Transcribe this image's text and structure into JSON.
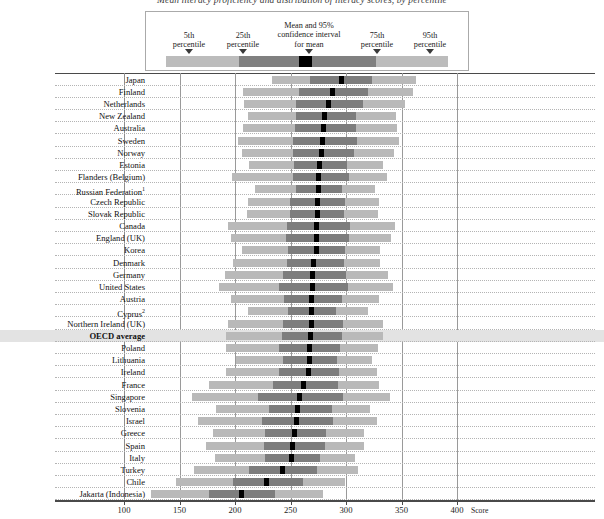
{
  "title": "Mean literacy proficiency and distribution of literacy scores, by percentile",
  "legend": {
    "items": [
      {
        "name": "p5",
        "label": "5th\npercentile",
        "value": 5
      },
      {
        "name": "p25",
        "label": "25th\npercentile",
        "value": 25
      },
      {
        "name": "mean",
        "label": "Mean and 95%\nconfidence interval\nfor mean",
        "value": 50
      },
      {
        "name": "p75",
        "label": "75th\npercentile",
        "value": 75
      },
      {
        "name": "p95",
        "label": "95th\npercentile",
        "value": 95
      }
    ],
    "labels": {
      "p5_line1": "5th",
      "p5_line2": "percentile",
      "p25_line1": "25th",
      "p25_line2": "percentile",
      "mean_line1": "Mean and 95%",
      "mean_line2": "confidence interval",
      "mean_line3": "for mean",
      "p75_line1": "75th",
      "p75_line2": "percentile",
      "p95_line1": "95th",
      "p95_line2": "percentile"
    }
  },
  "axis": {
    "label": "Score",
    "ticks": [
      100,
      150,
      200,
      250,
      300,
      350,
      400
    ],
    "tick_labels": [
      "100",
      "150",
      "200",
      "250",
      "300",
      "350",
      "400"
    ],
    "min": 100,
    "max": 400,
    "px_at_min": 124,
    "px_at_max": 457
  },
  "chart_data": {
    "type": "bar",
    "title": "Mean literacy proficiency and distribution of literacy scores, by percentile",
    "xlabel": "Score",
    "ylabel": "",
    "xlim": [
      100,
      400
    ],
    "grid": true,
    "legend_position": "top",
    "series_description": "Horizontal range bars showing 5th-95th percentile (light grey), 25th-75th percentile (dark grey), and mean with 95% confidence interval (black marker)",
    "categories": [
      "Japan",
      "Finland",
      "Netherlands",
      "New Zealand",
      "Australia",
      "Sweden",
      "Norway",
      "Estonia",
      "Flanders (Belgium)",
      "Russian Federation",
      "Czech Republic",
      "Slovak Republic",
      "Canada",
      "England (UK)",
      "Korea",
      "Denmark",
      "Germany",
      "United States",
      "Austria",
      "Cyprus",
      "Northern Ireland (UK)",
      "OECD average",
      "Poland",
      "Lithuania",
      "Ireland",
      "France",
      "Singapore",
      "Slovenia",
      "Israel",
      "Greece",
      "Spain",
      "Italy",
      "Turkey",
      "Chile",
      "Jakarta (Indonesia)"
    ],
    "rows": [
      {
        "country": "Japan",
        "footnote": null,
        "highlight": false,
        "bold": false,
        "p5": 233,
        "p25": 268,
        "mean": 296,
        "p75": 323,
        "p95": 363
      },
      {
        "country": "Finland",
        "footnote": null,
        "highlight": false,
        "bold": false,
        "p5": 207,
        "p25": 258,
        "mean": 288,
        "p75": 320,
        "p95": 360
      },
      {
        "country": "Netherlands",
        "footnote": null,
        "highlight": false,
        "bold": false,
        "p5": 208,
        "p25": 255,
        "mean": 284,
        "p75": 315,
        "p95": 353
      },
      {
        "country": "New Zealand",
        "footnote": null,
        "highlight": false,
        "bold": false,
        "p5": 212,
        "p25": 255,
        "mean": 281,
        "p75": 309,
        "p95": 345
      },
      {
        "country": "Australia",
        "footnote": null,
        "highlight": false,
        "bold": false,
        "p5": 207,
        "p25": 254,
        "mean": 280,
        "p75": 309,
        "p95": 346
      },
      {
        "country": "Sweden",
        "footnote": null,
        "highlight": false,
        "bold": false,
        "p5": 203,
        "p25": 252,
        "mean": 279,
        "p75": 310,
        "p95": 348
      },
      {
        "country": "Norway",
        "footnote": null,
        "highlight": false,
        "bold": false,
        "p5": 206,
        "p25": 252,
        "mean": 278,
        "p75": 307,
        "p95": 343
      },
      {
        "country": "Estonia",
        "footnote": null,
        "highlight": false,
        "bold": false,
        "p5": 213,
        "p25": 253,
        "mean": 276,
        "p75": 301,
        "p95": 333
      },
      {
        "country": "Flanders (Belgium)",
        "footnote": null,
        "highlight": false,
        "bold": false,
        "p5": 197,
        "p25": 252,
        "mean": 275,
        "p75": 303,
        "p95": 337
      },
      {
        "country": "Russian Federation",
        "footnote": "1",
        "highlight": false,
        "bold": false,
        "p5": 218,
        "p25": 255,
        "mean": 275,
        "p75": 296,
        "p95": 326
      },
      {
        "country": "Czech Republic",
        "footnote": null,
        "highlight": false,
        "bold": false,
        "p5": 212,
        "p25": 250,
        "mean": 274,
        "p75": 299,
        "p95": 330
      },
      {
        "country": "Slovak Republic",
        "footnote": null,
        "highlight": false,
        "bold": false,
        "p5": 211,
        "p25": 250,
        "mean": 274,
        "p75": 298,
        "p95": 329
      },
      {
        "country": "Canada",
        "footnote": null,
        "highlight": false,
        "bold": false,
        "p5": 194,
        "p25": 247,
        "mean": 273,
        "p75": 304,
        "p95": 344
      },
      {
        "country": "England (UK)",
        "footnote": null,
        "highlight": false,
        "bold": false,
        "p5": 196,
        "p25": 246,
        "mean": 273,
        "p75": 303,
        "p95": 341
      },
      {
        "country": "Korea",
        "footnote": null,
        "highlight": false,
        "bold": false,
        "p5": 206,
        "p25": 248,
        "mean": 273,
        "p75": 299,
        "p95": 331
      },
      {
        "country": "Denmark",
        "footnote": null,
        "highlight": false,
        "bold": false,
        "p5": 198,
        "p25": 247,
        "mean": 271,
        "p75": 298,
        "p95": 331
      },
      {
        "country": "Germany",
        "footnote": null,
        "highlight": false,
        "bold": false,
        "p5": 191,
        "p25": 243,
        "mean": 270,
        "p75": 300,
        "p95": 338
      },
      {
        "country": "United States",
        "footnote": null,
        "highlight": false,
        "bold": false,
        "p5": 186,
        "p25": 240,
        "mean": 270,
        "p75": 302,
        "p95": 342
      },
      {
        "country": "Austria",
        "footnote": null,
        "highlight": false,
        "bold": false,
        "p5": 196,
        "p25": 244,
        "mean": 269,
        "p75": 296,
        "p95": 330
      },
      {
        "country": "Cyprus",
        "footnote": "2",
        "highlight": false,
        "bold": false,
        "p5": 212,
        "p25": 248,
        "mean": 269,
        "p75": 291,
        "p95": 320
      },
      {
        "country": "Northern Ireland (UK)",
        "footnote": null,
        "highlight": false,
        "bold": false,
        "p5": 194,
        "p25": 243,
        "mean": 269,
        "p75": 297,
        "p95": 333
      },
      {
        "country": "OECD average",
        "footnote": null,
        "highlight": true,
        "bold": true,
        "p5": 192,
        "p25": 242,
        "mean": 268,
        "p75": 296,
        "p95": 333
      },
      {
        "country": "Poland",
        "footnote": null,
        "highlight": false,
        "bold": false,
        "p5": 192,
        "p25": 240,
        "mean": 267,
        "p75": 295,
        "p95": 329
      },
      {
        "country": "Lithuania",
        "footnote": null,
        "highlight": false,
        "bold": false,
        "p5": 201,
        "p25": 243,
        "mean": 267,
        "p75": 292,
        "p95": 323
      },
      {
        "country": "Ireland",
        "footnote": null,
        "highlight": false,
        "bold": false,
        "p5": 192,
        "p25": 240,
        "mean": 266,
        "p75": 294,
        "p95": 328
      },
      {
        "country": "France",
        "footnote": null,
        "highlight": false,
        "bold": false,
        "p5": 177,
        "p25": 234,
        "mean": 262,
        "p75": 293,
        "p95": 330
      },
      {
        "country": "Singapore",
        "footnote": null,
        "highlight": false,
        "bold": false,
        "p5": 161,
        "p25": 221,
        "mean": 258,
        "p75": 297,
        "p95": 340
      },
      {
        "country": "Slovenia",
        "footnote": null,
        "highlight": false,
        "bold": false,
        "p5": 183,
        "p25": 231,
        "mean": 256,
        "p75": 287,
        "p95": 322
      },
      {
        "country": "Israel",
        "footnote": null,
        "highlight": false,
        "bold": false,
        "p5": 167,
        "p25": 224,
        "mean": 255,
        "p75": 288,
        "p95": 328
      },
      {
        "country": "Greece",
        "footnote": null,
        "highlight": false,
        "bold": false,
        "p5": 180,
        "p25": 227,
        "mean": 254,
        "p75": 282,
        "p95": 316
      },
      {
        "country": "Spain",
        "footnote": null,
        "highlight": false,
        "bold": false,
        "p5": 174,
        "p25": 226,
        "mean": 252,
        "p75": 281,
        "p95": 316
      },
      {
        "country": "Italy",
        "footnote": null,
        "highlight": false,
        "bold": false,
        "p5": 182,
        "p25": 227,
        "mean": 251,
        "p75": 277,
        "p95": 308
      },
      {
        "country": "Turkey",
        "footnote": null,
        "highlight": false,
        "bold": false,
        "p5": 163,
        "p25": 213,
        "mean": 243,
        "p75": 274,
        "p95": 311
      },
      {
        "country": "Chile",
        "footnote": null,
        "highlight": false,
        "bold": false,
        "p5": 147,
        "p25": 198,
        "mean": 228,
        "p75": 261,
        "p95": 299
      },
      {
        "country": "Jakarta (Indonesia)",
        "footnote": null,
        "highlight": false,
        "bold": false,
        "p5": 124,
        "p25": 177,
        "mean": 206,
        "p75": 236,
        "p95": 279
      }
    ]
  }
}
